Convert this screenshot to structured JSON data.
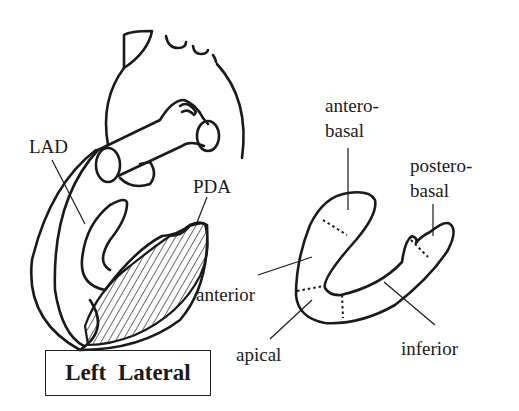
{
  "figure": {
    "title": "Left Lateral",
    "left_view": {
      "labels": {
        "lad": "LAD",
        "pda": "PDA"
      },
      "hatched_region": "PDA territory (inferior wall)"
    },
    "right_view": {
      "segments": {
        "antero_basal_line1": "antero-",
        "antero_basal_line2": "basal",
        "postero_basal_line1": "postero-",
        "postero_basal_line2": "basal",
        "anterior": "anterior",
        "apical": "apical",
        "inferior": "inferior"
      }
    }
  },
  "colors": {
    "ink": "#1a1a1a",
    "background": "#ffffff"
  }
}
